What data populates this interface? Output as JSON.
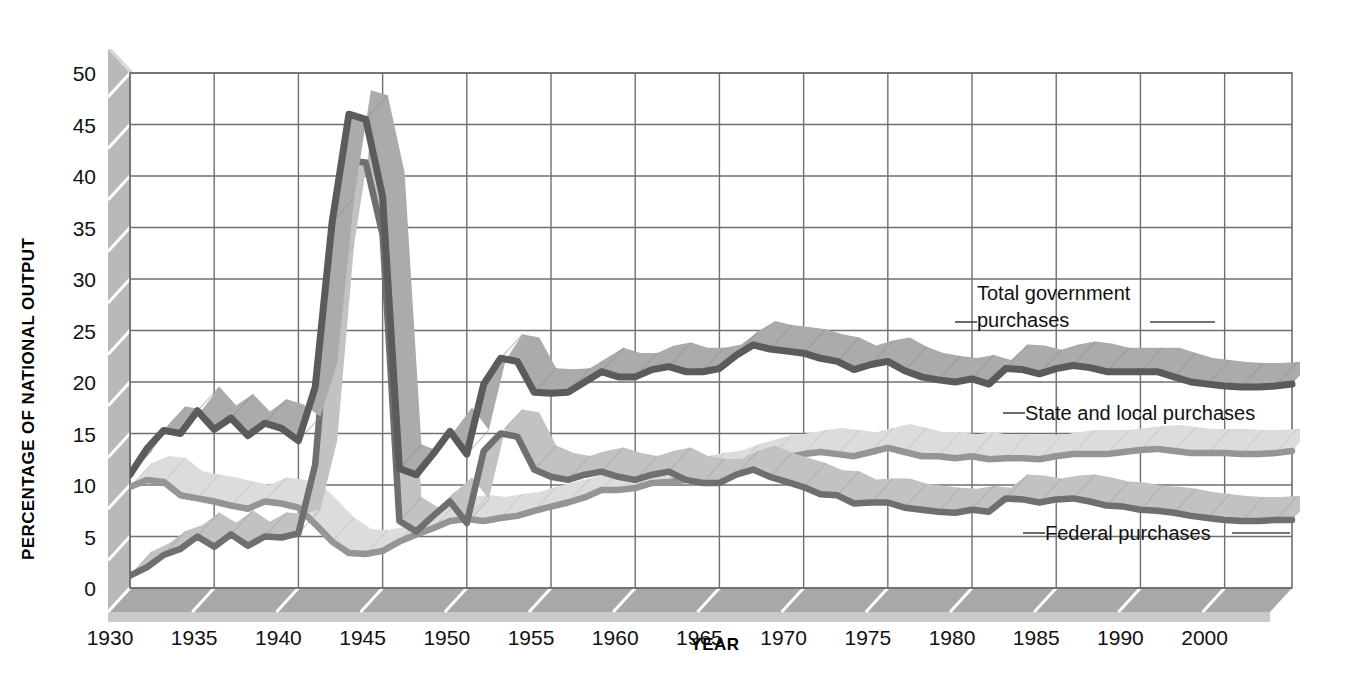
{
  "chart_data": {
    "type": "line",
    "title": "",
    "xlabel": "YEAR",
    "ylabel": "PERCENTAGE OF NATIONAL OUTPUT",
    "xlim": [
      1930,
      1999
    ],
    "ylim": [
      0,
      50
    ],
    "grid": true,
    "legend_position": "inline-annotations",
    "xticks": [
      "1930",
      "1935",
      "1940",
      "1945",
      "1950",
      "1955",
      "1960",
      "1965",
      "1970",
      "1975",
      "1980",
      "1985",
      "1990",
      "2000"
    ],
    "xtick_values": [
      1930,
      1935,
      1940,
      1945,
      1950,
      1955,
      1960,
      1965,
      1970,
      1975,
      1980,
      1985,
      1990,
      1995
    ],
    "yticks": [
      "0",
      "5",
      "10",
      "15",
      "20",
      "25",
      "30",
      "35",
      "40",
      "45",
      "50"
    ],
    "ytick_values": [
      0,
      5,
      10,
      15,
      20,
      25,
      30,
      35,
      40,
      45,
      50
    ],
    "colors": {
      "total_line": "#5d5d5d",
      "total_band": "#a9a9a9",
      "state_line": "#8f8f8f",
      "state_band": "#d5d5d5",
      "federal_line": "#6e6e6e",
      "federal_band": "#bdbdbd",
      "grid": "#6f6f6f",
      "wall": "#b8b8b8",
      "floor": "#a3a3a3",
      "text": "#111111"
    },
    "x": [
      1930,
      1931,
      1932,
      1933,
      1934,
      1935,
      1936,
      1937,
      1938,
      1939,
      1940,
      1941,
      1942,
      1943,
      1944,
      1945,
      1946,
      1947,
      1948,
      1949,
      1950,
      1951,
      1952,
      1953,
      1954,
      1955,
      1956,
      1957,
      1958,
      1959,
      1960,
      1961,
      1962,
      1963,
      1964,
      1965,
      1966,
      1967,
      1968,
      1969,
      1970,
      1971,
      1972,
      1973,
      1974,
      1975,
      1976,
      1977,
      1978,
      1979,
      1980,
      1981,
      1982,
      1983,
      1984,
      1985,
      1986,
      1987,
      1988,
      1989,
      1990,
      1991,
      1992,
      1993,
      1994,
      1995,
      1996,
      1997,
      1998,
      1999
    ],
    "series": [
      {
        "name": "Total government purchases",
        "label": "Total government purchases",
        "values": [
          11.0,
          13.5,
          15.3,
          15.0,
          17.2,
          15.4,
          16.5,
          14.8,
          16.0,
          15.5,
          14.3,
          19.5,
          35.5,
          46.0,
          45.5,
          38.0,
          11.6,
          11.0,
          13.0,
          15.2,
          13.0,
          19.8,
          22.3,
          22.0,
          19.0,
          18.9,
          19.0,
          20.0,
          21.0,
          20.5,
          20.5,
          21.2,
          21.5,
          21.0,
          21.0,
          21.3,
          22.6,
          23.6,
          23.2,
          23.0,
          22.8,
          22.3,
          22.0,
          21.2,
          21.7,
          22.0,
          21.1,
          20.5,
          20.2,
          20.0,
          20.3,
          19.8,
          21.3,
          21.2,
          20.8,
          21.3,
          21.6,
          21.4,
          21.0,
          21.0,
          21.0,
          21.0,
          20.5,
          20.0,
          19.8,
          19.6,
          19.5,
          19.5,
          19.6,
          19.8
        ],
        "annotation": {
          "text_line1": "Total government",
          "text_line2": "purchases",
          "x": 1975,
          "y": 27.5
        }
      },
      {
        "name": "State and local purchases",
        "label": "State and local purchases",
        "values": [
          9.8,
          10.5,
          10.3,
          9.0,
          8.7,
          8.4,
          8.0,
          7.7,
          8.4,
          8.2,
          7.8,
          6.2,
          4.5,
          3.4,
          3.3,
          3.6,
          4.5,
          5.2,
          5.8,
          6.5,
          6.7,
          6.5,
          6.8,
          7.0,
          7.5,
          7.9,
          8.3,
          8.8,
          9.5,
          9.5,
          9.7,
          10.2,
          10.3,
          10.5,
          10.8,
          11.0,
          11.6,
          12.1,
          12.5,
          12.7,
          13.0,
          13.2,
          13.0,
          12.8,
          13.2,
          13.6,
          13.2,
          12.8,
          12.8,
          12.6,
          12.8,
          12.5,
          12.6,
          12.6,
          12.5,
          12.8,
          13.0,
          13.0,
          13.0,
          13.2,
          13.4,
          13.5,
          13.3,
          13.1,
          13.1,
          13.1,
          13.0,
          13.0,
          13.1,
          13.3
        ],
        "annotation": {
          "text": "State and local purchases",
          "x": 1986,
          "y": 16.3
        }
      },
      {
        "name": "Federal purchases",
        "label": "Federal purchases",
        "values": [
          1.2,
          2.0,
          3.2,
          3.8,
          5.0,
          4.0,
          5.2,
          4.1,
          5.0,
          4.9,
          5.3,
          12.0,
          31.0,
          41.5,
          41.3,
          34.3,
          6.5,
          5.5,
          7.0,
          8.4,
          6.3,
          13.3,
          15.0,
          14.7,
          11.5,
          10.8,
          10.5,
          11.0,
          11.3,
          10.8,
          10.5,
          11.0,
          11.3,
          10.5,
          10.2,
          10.2,
          11.0,
          11.5,
          10.8,
          10.3,
          9.8,
          9.1,
          9.0,
          8.2,
          8.3,
          8.3,
          7.8,
          7.6,
          7.4,
          7.3,
          7.6,
          7.4,
          8.7,
          8.6,
          8.3,
          8.6,
          8.7,
          8.4,
          8.0,
          7.9,
          7.6,
          7.5,
          7.3,
          7.0,
          6.8,
          6.6,
          6.5,
          6.5,
          6.6,
          6.6
        ],
        "annotation": {
          "text": "Federal purchases",
          "x": 1987,
          "y": 5.1
        }
      }
    ]
  }
}
